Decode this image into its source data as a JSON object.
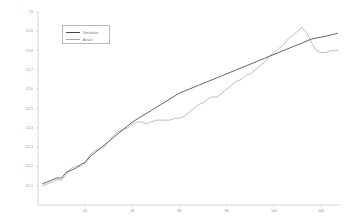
{
  "chart_data": {
    "type": "line",
    "title": "",
    "subtitle": "",
    "xlabel": "",
    "ylabel": "",
    "xlim": [
      0,
      128
    ],
    "ylim": [
      12.0,
      13.0
    ],
    "grid": false,
    "legend_position": "top-left",
    "x_ticks": [
      20,
      40,
      60,
      80,
      100,
      120
    ],
    "x_tick_labels": [
      "20",
      "40",
      "60",
      "80",
      "100",
      "120"
    ],
    "y_ticks": [
      12.1,
      12.2,
      12.3,
      12.4,
      12.5,
      12.6,
      12.7,
      12.8,
      12.9,
      13.0
    ],
    "y_tick_labels": [
      "12.1",
      "12.2",
      "12.3",
      "12.4",
      "12.5",
      "12.6",
      "12.7",
      "12.8",
      "12.9",
      "13"
    ],
    "series": [
      {
        "name": "Simulation",
        "color": "#4a4a4a",
        "x": [
          2,
          4,
          6,
          8,
          10,
          12,
          14,
          16,
          18,
          20,
          22,
          24,
          26,
          28,
          30,
          32,
          34,
          36,
          38,
          40,
          44,
          48,
          52,
          56,
          60,
          64,
          68,
          72,
          76,
          80,
          84,
          88,
          92,
          96,
          100,
          104,
          108,
          112,
          116,
          120,
          124,
          127
        ],
        "values": [
          12.11,
          12.12,
          12.13,
          12.14,
          12.14,
          12.17,
          12.18,
          12.19,
          12.21,
          12.22,
          12.25,
          12.27,
          12.29,
          12.31,
          12.33,
          12.35,
          12.37,
          12.39,
          12.41,
          12.43,
          12.46,
          12.49,
          12.52,
          12.55,
          12.58,
          12.6,
          12.62,
          12.64,
          12.66,
          12.68,
          12.7,
          12.72,
          12.74,
          12.76,
          12.78,
          12.8,
          12.82,
          12.84,
          12.86,
          12.87,
          12.88,
          12.89
        ]
      },
      {
        "name": "Actual",
        "color": "#a8a8a8",
        "x": [
          2,
          4,
          6,
          8,
          10,
          12,
          14,
          16,
          18,
          20,
          22,
          24,
          26,
          28,
          30,
          32,
          34,
          36,
          38,
          40,
          42,
          44,
          46,
          48,
          50,
          52,
          54,
          56,
          58,
          60,
          62,
          64,
          66,
          68,
          70,
          72,
          74,
          76,
          78,
          80,
          82,
          84,
          86,
          88,
          90,
          92,
          94,
          96,
          98,
          100,
          102,
          104,
          106,
          108,
          110,
          112,
          114,
          116,
          118,
          120,
          122,
          124,
          126,
          127
        ],
        "values": [
          12.1,
          12.11,
          12.12,
          12.13,
          12.13,
          12.16,
          12.19,
          12.2,
          12.2,
          12.22,
          12.26,
          12.28,
          12.29,
          12.3,
          12.33,
          12.36,
          12.38,
          12.39,
          12.4,
          12.42,
          12.43,
          12.43,
          12.42,
          12.43,
          12.44,
          12.44,
          12.44,
          12.44,
          12.45,
          12.45,
          12.46,
          12.48,
          12.5,
          12.52,
          12.53,
          12.55,
          12.56,
          12.56,
          12.58,
          12.6,
          12.62,
          12.64,
          12.65,
          12.67,
          12.68,
          12.7,
          12.72,
          12.74,
          12.77,
          12.79,
          12.81,
          12.83,
          12.86,
          12.88,
          12.9,
          12.92,
          12.89,
          12.84,
          12.8,
          12.79,
          12.79,
          12.8,
          12.8,
          12.8
        ]
      }
    ]
  },
  "legend": {
    "items": [
      {
        "label": "Simulation",
        "color": "#4a4a4a"
      },
      {
        "label": "Actual",
        "color": "#a8a8a8"
      }
    ]
  },
  "axes": {
    "axis_color": "#c4c4c4",
    "tick_color": "#8a8a8a"
  }
}
